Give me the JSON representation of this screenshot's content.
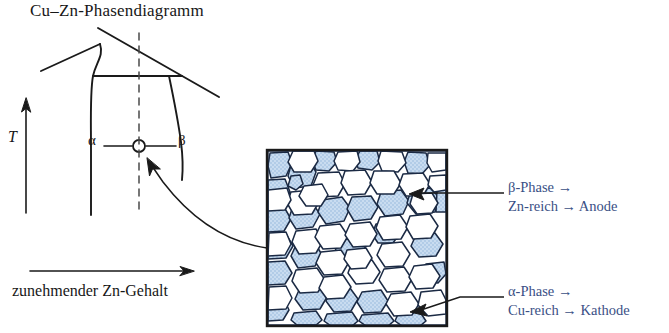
{
  "figure": {
    "title": "Cu–Zn-Phasendiagramm",
    "background": "#ffffff",
    "ink": "#1a1a1a",
    "callout_color": "#3a4f85",
    "grain_blue": "#bcd2ea"
  },
  "phase_diagram": {
    "title": "Cu–Zn-Phasendiagramm",
    "y_axis_label": "T",
    "x_axis_caption": "zunehmender Zn-Gehalt",
    "phase_left_label": "α",
    "phase_right_label": "β",
    "marker_name": "composition-marker",
    "dashed_line_name": "composition-dashed-line"
  },
  "micrograph": {
    "name": "microstructure-panel",
    "alpha_fill": "white",
    "beta_fill": "#bcd2ea"
  },
  "callouts": [
    {
      "id": "beta",
      "line1": "β-Phase →",
      "line2": "Zn-reich → Anode",
      "phase": "β",
      "composition": "Zn-reich",
      "role": "Anode"
    },
    {
      "id": "alpha",
      "line1": "α-Phase →",
      "line2": "Cu-reich → Kathode",
      "phase": "α",
      "composition": "Cu-reich",
      "role": "Kathode"
    }
  ]
}
